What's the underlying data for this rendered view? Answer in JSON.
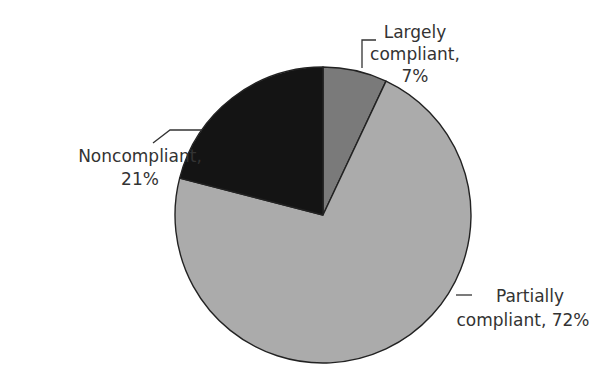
{
  "chart_data": {
    "type": "pie",
    "title": "",
    "start_angle_deg": 0,
    "direction": "clockwise",
    "slices": [
      {
        "name": "Largely compliant",
        "value": 7,
        "label_line1": "Largely",
        "label_line2": "compliant,",
        "label_line3": "7%",
        "color": "#7a7a7a"
      },
      {
        "name": "Partially compliant",
        "value": 72,
        "label_line1": "Partially",
        "label_line2": "compliant, 72%",
        "color": "#ababab"
      },
      {
        "name": "Noncompliant",
        "value": 21,
        "label_line1": "Noncompliant,",
        "label_line2": "21%",
        "color": "#141414"
      }
    ],
    "legend": "none (direct labels with leader lines)"
  },
  "labels": {
    "largely": {
      "line1": "Largely",
      "line2": "compliant,",
      "line3": "7%"
    },
    "partially": {
      "line1": "Partially",
      "line2": "compliant, 72%"
    },
    "noncompliant": {
      "line1": "Noncompliant,",
      "line2": "21%"
    }
  }
}
